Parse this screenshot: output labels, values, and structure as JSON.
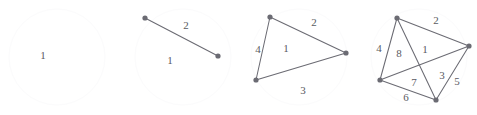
{
  "page": {
    "background_color": "#ffffff",
    "stroke_color": "#6b6b73",
    "label_color": "#5a5a62",
    "faint_circle_color": "#fbfbfc",
    "width": 477,
    "height": 115
  },
  "figures": [
    {
      "id": "figure-1",
      "caption": "single face, no vertices",
      "vertex_count": 0,
      "edge_count": 0,
      "outer_circle": {
        "cx": 57,
        "cy": 57,
        "r": 48
      },
      "vertices": [],
      "edges": [],
      "labels": [
        {
          "text": "1",
          "x": 43,
          "y": 59,
          "role": "face-label"
        }
      ]
    },
    {
      "id": "figure-2",
      "caption": "two vertices joined by one edge",
      "vertex_count": 2,
      "edge_count": 1,
      "outer_circle": {
        "cx": 183,
        "cy": 57,
        "r": 48
      },
      "vertices": [
        {
          "id": "v1",
          "x": 145,
          "y": 18
        },
        {
          "id": "v2",
          "x": 218,
          "y": 56
        }
      ],
      "edges": [
        {
          "from": "v1",
          "to": "v2",
          "label": "2"
        }
      ],
      "labels": [
        {
          "text": "2",
          "x": 186,
          "y": 29,
          "role": "edge-label"
        },
        {
          "text": "1",
          "x": 170,
          "y": 64,
          "role": "face-label"
        }
      ]
    },
    {
      "id": "figure-3",
      "caption": "triangle with three vertices and three edges",
      "vertex_count": 3,
      "edge_count": 3,
      "outer_circle": {
        "cx": 299,
        "cy": 57,
        "r": 48
      },
      "vertices": [
        {
          "id": "v1",
          "x": 270,
          "y": 17
        },
        {
          "id": "v2",
          "x": 256,
          "y": 80
        },
        {
          "id": "v3",
          "x": 346,
          "y": 53
        }
      ],
      "edges": [
        {
          "from": "v1",
          "to": "v2",
          "label": "4"
        },
        {
          "from": "v1",
          "to": "v3",
          "label": "2"
        },
        {
          "from": "v2",
          "to": "v3",
          "label": "3"
        }
      ],
      "labels": [
        {
          "text": "4",
          "x": 258,
          "y": 53,
          "role": "edge-label"
        },
        {
          "text": "2",
          "x": 314,
          "y": 26,
          "role": "edge-label"
        },
        {
          "text": "3",
          "x": 303,
          "y": 94,
          "role": "edge-label"
        },
        {
          "text": "1",
          "x": 286,
          "y": 52,
          "role": "face-label"
        }
      ]
    },
    {
      "id": "figure-4",
      "caption": "four vertices with six edges forming eight labelled regions",
      "vertex_count": 4,
      "edge_count": 6,
      "outer_circle": {
        "cx": 419,
        "cy": 57,
        "r": 48
      },
      "vertices": [
        {
          "id": "v1",
          "x": 397,
          "y": 18
        },
        {
          "id": "v2",
          "x": 380,
          "y": 80
        },
        {
          "id": "v3",
          "x": 469,
          "y": 46
        },
        {
          "id": "v4",
          "x": 436,
          "y": 100
        }
      ],
      "edges": [
        {
          "from": "v1",
          "to": "v2",
          "label": "4"
        },
        {
          "from": "v1",
          "to": "v3",
          "label": "2"
        },
        {
          "from": "v1",
          "to": "v4",
          "label": "8"
        },
        {
          "from": "v2",
          "to": "v3",
          "label": "7"
        },
        {
          "from": "v2",
          "to": "v4",
          "label": "6"
        },
        {
          "from": "v3",
          "to": "v4",
          "label": "5"
        }
      ],
      "labels": [
        {
          "text": "2",
          "x": 436,
          "y": 24,
          "role": "edge-label"
        },
        {
          "text": "4",
          "x": 379,
          "y": 52,
          "role": "edge-label"
        },
        {
          "text": "8",
          "x": 399,
          "y": 57,
          "role": "face-label"
        },
        {
          "text": "1",
          "x": 425,
          "y": 53,
          "role": "face-label"
        },
        {
          "text": "7",
          "x": 414,
          "y": 86,
          "role": "face-label"
        },
        {
          "text": "3",
          "x": 442,
          "y": 79,
          "role": "face-label"
        },
        {
          "text": "5",
          "x": 457,
          "y": 85,
          "role": "edge-label"
        },
        {
          "text": "6",
          "x": 406,
          "y": 101,
          "role": "edge-label"
        }
      ]
    }
  ]
}
